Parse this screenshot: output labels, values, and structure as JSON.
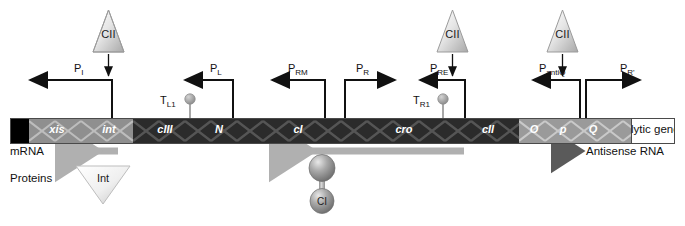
{
  "diagram": {
    "colors": {
      "gene_dark": "#2b2b2b",
      "gene_light": "#8f8f8f",
      "gene_mid": "#9a9a9a",
      "gene_black": "#000000",
      "mrna_arrow": "#b0b0b0",
      "antisense_arrow": "#5a5a5a",
      "terminator": "#9e9e9e",
      "line": "#111111"
    }
  },
  "activators": [
    {
      "label": "CII",
      "x": 93,
      "y": 8
    },
    {
      "label": "CII",
      "x": 437,
      "y": 8
    },
    {
      "label": "CII",
      "x": 547,
      "y": 8
    }
  ],
  "promoters": [
    {
      "name": "P",
      "sub": "I",
      "label_x": 74,
      "label_y": 64
    },
    {
      "name": "P",
      "sub": "L",
      "label_x": 210,
      "label_y": 64
    },
    {
      "name": "P",
      "sub": "RM",
      "label_x": 290,
      "label_y": 64
    },
    {
      "name": "P",
      "sub": "R",
      "label_x": 355,
      "label_y": 64
    },
    {
      "name": "P",
      "sub": "RE",
      "label_x": 432,
      "label_y": 64
    },
    {
      "name": "P",
      "sub": "antiQ",
      "label_x": 540,
      "label_y": 64
    },
    {
      "name": "P",
      "sub": "R'",
      "label_x": 618,
      "label_y": 64
    }
  ],
  "terminators": [
    {
      "name": "T",
      "sub": "L1",
      "label_x": 160,
      "label_y": 94
    },
    {
      "name": "T",
      "sub": "R1",
      "label_x": 412,
      "label_y": 94
    }
  ],
  "genes": [
    {
      "label": "",
      "x": 0,
      "w": 18,
      "fill": "black",
      "text": "none"
    },
    {
      "label": "xis",
      "x": 18,
      "w": 56,
      "fill": "light",
      "text": "on-light"
    },
    {
      "label": "int",
      "x": 74,
      "w": 48,
      "fill": "light",
      "text": "on-light"
    },
    {
      "label": "cIII",
      "x": 126,
      "w": 56,
      "fill": "dark",
      "text": "on-dark"
    },
    {
      "label": "N",
      "x": 182,
      "w": 52,
      "fill": "dark",
      "text": "on-dark"
    },
    {
      "label": "cI",
      "x": 234,
      "w": 106,
      "fill": "dark",
      "text": "on-dark"
    },
    {
      "label": "cro",
      "x": 340,
      "w": 106,
      "fill": "dark",
      "text": "on-dark"
    },
    {
      "label": "cII",
      "x": 446,
      "w": 62,
      "fill": "dark",
      "text": "on-dark"
    },
    {
      "label": "O",
      "x": 508,
      "w": 30,
      "fill": "mid",
      "text": "on-light"
    },
    {
      "label": "p",
      "x": 538,
      "w": 28,
      "fill": "mid",
      "text": "on-light"
    },
    {
      "label": "Q",
      "x": 566,
      "w": 32,
      "fill": "mid",
      "text": "on-light"
    },
    {
      "label": "",
      "x": 598,
      "w": 22,
      "fill": "mid",
      "text": "none"
    },
    {
      "label": "lytic genes",
      "x": 620,
      "w": 45,
      "fill": "white",
      "text": "on-white"
    }
  ],
  "transcripts": {
    "mrna_row_label": "mRNA",
    "proteins_row_label": "Proteins",
    "antisense_label": "Antisense RNA"
  },
  "proteins": [
    {
      "label": "Int",
      "type": "inverted-triangle"
    },
    {
      "label": "CI",
      "type": "dimer"
    }
  ]
}
